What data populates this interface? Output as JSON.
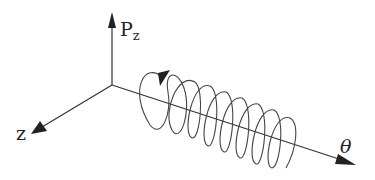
{
  "diagram": {
    "type": "3d-axes-helix",
    "axes": {
      "vertical": {
        "label_main": "P",
        "label_sub": "z"
      },
      "depth": {
        "label": "z"
      },
      "horizontal": {
        "label": "θ"
      }
    },
    "helix": {
      "loops": 8,
      "direction_arrow": true
    },
    "colors": {
      "stroke": "#333333",
      "background": "#ffffff"
    }
  }
}
